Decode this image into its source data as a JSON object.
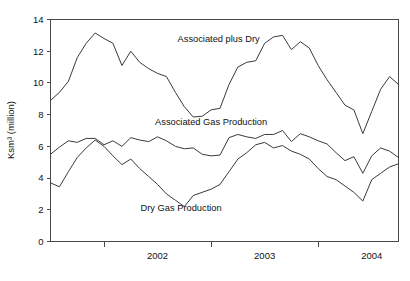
{
  "chart_data": {
    "type": "line",
    "title": "",
    "xlabel": "",
    "ylabel": "Ksm³ (million)",
    "ylim": [
      0,
      14
    ],
    "yticks": [
      0,
      2,
      4,
      6,
      8,
      10,
      12,
      14
    ],
    "ytick_labels": [
      "0",
      "2",
      "4",
      "6",
      "8",
      "10",
      "12",
      "14"
    ],
    "xlim": [
      2001.5,
      2004.75
    ],
    "xticks": [
      2002,
      2003,
      2004,
      2005
    ],
    "xtick_labels": [
      "2002",
      "2003",
      "2004"
    ],
    "xtick_label_positions": [
      2002.5,
      2003.5,
      2004.5
    ],
    "grid": false,
    "legend": "none",
    "annotations": [
      {
        "text": "Associated plus Dry",
        "x": 2003.07,
        "y": 12.6
      },
      {
        "text": "Associated Gas Production",
        "x": 2003.0,
        "y": 7.35
      },
      {
        "text": "Dry Gas Production",
        "x": 2002.72,
        "y": 1.95
      }
    ],
    "x": [
      2001.5,
      2001.583,
      2001.667,
      2001.75,
      2001.833,
      2001.917,
      2002.0,
      2002.083,
      2002.167,
      2002.25,
      2002.333,
      2002.417,
      2002.5,
      2002.583,
      2002.667,
      2002.75,
      2002.833,
      2002.917,
      2003.0,
      2003.083,
      2003.167,
      2003.25,
      2003.333,
      2003.417,
      2003.5,
      2003.583,
      2003.667,
      2003.75,
      2003.833,
      2003.917,
      2004.0,
      2004.083,
      2004.167,
      2004.25,
      2004.333,
      2004.417,
      2004.5,
      2004.583,
      2004.667,
      2004.75
    ],
    "series": [
      {
        "name": "Associated plus Dry",
        "values": [
          8.9,
          9.4,
          10.1,
          11.6,
          12.5,
          13.15,
          12.8,
          12.5,
          11.1,
          12.0,
          11.3,
          10.9,
          10.6,
          10.4,
          9.4,
          8.5,
          7.85,
          7.9,
          8.3,
          8.4,
          9.9,
          11.0,
          11.3,
          11.4,
          12.5,
          12.9,
          13.0,
          12.1,
          12.6,
          12.2,
          11.1,
          10.2,
          9.4,
          8.6,
          8.3,
          6.8,
          8.2,
          9.6,
          10.4,
          9.9
        ]
      },
      {
        "name": "Associated Gas Production",
        "values": [
          5.5,
          5.95,
          6.35,
          6.25,
          6.5,
          6.5,
          6.1,
          6.35,
          6.0,
          6.55,
          6.4,
          6.3,
          6.6,
          6.35,
          6.0,
          5.85,
          5.9,
          5.5,
          5.4,
          5.45,
          6.55,
          6.75,
          6.6,
          6.5,
          6.75,
          6.75,
          7.0,
          6.3,
          6.8,
          6.6,
          6.35,
          6.15,
          5.6,
          5.1,
          5.35,
          4.3,
          5.4,
          5.9,
          5.7,
          5.3
        ]
      },
      {
        "name": "Dry Gas Production",
        "values": [
          3.7,
          3.45,
          4.4,
          5.3,
          5.9,
          6.4,
          6.0,
          5.4,
          4.85,
          5.2,
          4.6,
          4.1,
          3.6,
          3.0,
          2.6,
          2.2,
          2.9,
          3.1,
          3.3,
          3.6,
          4.4,
          5.2,
          5.6,
          6.1,
          6.25,
          5.9,
          6.05,
          5.7,
          5.5,
          5.2,
          4.6,
          4.1,
          3.9,
          3.5,
          3.1,
          2.55,
          3.9,
          4.3,
          4.7,
          4.9
        ]
      }
    ]
  }
}
